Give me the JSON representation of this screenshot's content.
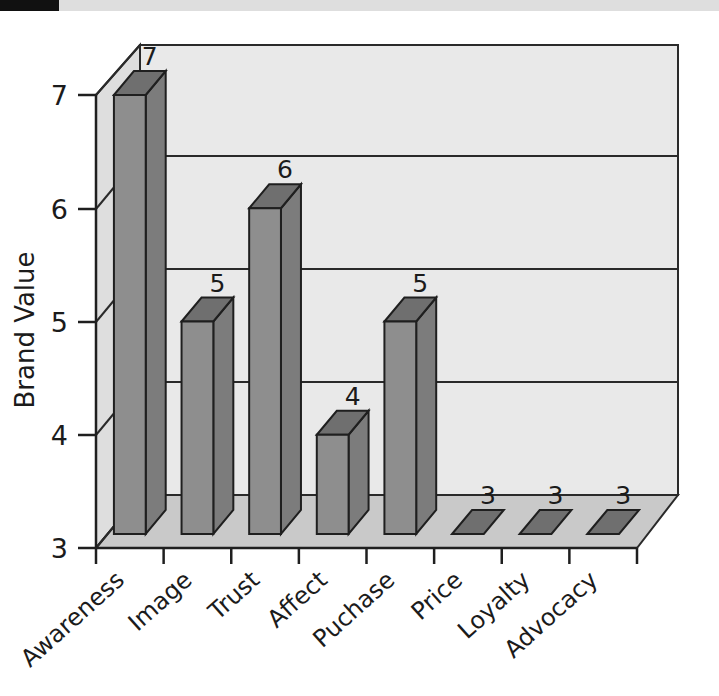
{
  "chart_data": {
    "type": "bar",
    "title": "",
    "subtitle": "",
    "xlabel": "",
    "ylabel": "Brand Value",
    "ylim": [
      3,
      7
    ],
    "yticks": [
      "3",
      "4",
      "5",
      "6",
      "7"
    ],
    "grid": true,
    "legend": "none",
    "style": "3d-column",
    "categories": [
      "Awareness",
      "Image",
      "Trust",
      "Affect",
      "Puchase",
      "Price",
      "Loyalty",
      "Advocacy"
    ],
    "values": [
      7,
      5,
      6,
      4,
      5,
      3,
      3,
      3
    ],
    "data_labels": [
      "7",
      "5",
      "6",
      "4",
      "5",
      "3",
      "3",
      "3"
    ],
    "colors": {
      "bar_front": "#8e8e8e",
      "bar_top": "#6f6f6f",
      "bar_side": "#7c7c7c",
      "back_wall": "#e9e9e9",
      "side_wall": "#dcdcdc",
      "floor": "#c9c9c9",
      "outline": "#1f1f1f",
      "text": "#1b1b1b",
      "page_background": "#ffffff",
      "scan_bar": "#111111"
    }
  },
  "axes": {
    "y_axis_title": "Brand Value",
    "y_tick_7": "7",
    "y_tick_6": "6",
    "y_tick_5": "5",
    "y_tick_4": "4",
    "y_tick_3": "3"
  },
  "bars": [
    {
      "category": "Awareness",
      "value": 7,
      "label": "7"
    },
    {
      "category": "Image",
      "value": 5,
      "label": "5"
    },
    {
      "category": "Trust",
      "value": 6,
      "label": "6"
    },
    {
      "category": "Affect",
      "value": 4,
      "label": "4"
    },
    {
      "category": "Puchase",
      "value": 5,
      "label": "5"
    },
    {
      "category": "Price",
      "value": 3,
      "label": "3"
    },
    {
      "category": "Loyalty",
      "value": 3,
      "label": "3"
    },
    {
      "category": "Advocacy",
      "value": 3,
      "label": "3"
    }
  ]
}
